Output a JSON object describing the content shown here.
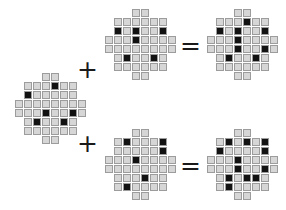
{
  "figure": {
    "colors": {
      "cell_light_fill": "#d6d6d6",
      "cell_light_border": "#9c9c9c",
      "cell_dark_fill": "#121212",
      "background": "#ffffff",
      "operator": "#1a1a1a"
    },
    "grid_size": {
      "cols": 8,
      "rows": 8,
      "cell_px": 9
    }
  },
  "operators": {
    "plus": "+",
    "equals": "="
  },
  "equations": [
    {
      "name": "top-equation",
      "operand_a": "shared-left-grid",
      "operand_b": "top-middle-grid",
      "result": "top-right-grid"
    },
    {
      "name": "bottom-equation",
      "operand_a": "shared-left-grid",
      "operand_b": "bottom-middle-grid",
      "result": "bottom-right-grid"
    }
  ],
  "grids": {
    "left": {
      "label": "shared-left-grid",
      "legend": {
        "0": "empty",
        "1": "light",
        "2": "dark"
      },
      "matrix": [
        [
          0,
          0,
          0,
          1,
          1,
          0,
          0,
          0
        ],
        [
          0,
          1,
          1,
          1,
          2,
          1,
          1,
          0
        ],
        [
          0,
          2,
          1,
          1,
          1,
          1,
          1,
          0
        ],
        [
          1,
          1,
          1,
          1,
          1,
          1,
          1,
          1
        ],
        [
          1,
          1,
          1,
          2,
          1,
          1,
          2,
          1
        ],
        [
          0,
          1,
          2,
          1,
          1,
          2,
          1,
          0
        ],
        [
          0,
          1,
          1,
          1,
          1,
          1,
          1,
          0
        ],
        [
          0,
          0,
          0,
          1,
          1,
          0,
          0,
          0
        ]
      ]
    },
    "top_middle": {
      "label": "top-middle-grid",
      "legend": {
        "0": "empty",
        "1": "light",
        "2": "dark"
      },
      "matrix": [
        [
          0,
          0,
          0,
          1,
          1,
          0,
          0,
          0
        ],
        [
          0,
          1,
          1,
          1,
          1,
          1,
          1,
          0
        ],
        [
          0,
          2,
          1,
          2,
          1,
          1,
          2,
          0
        ],
        [
          1,
          1,
          1,
          2,
          1,
          1,
          1,
          1
        ],
        [
          1,
          1,
          1,
          1,
          1,
          1,
          1,
          1
        ],
        [
          0,
          1,
          2,
          1,
          1,
          2,
          1,
          0
        ],
        [
          0,
          1,
          1,
          1,
          1,
          1,
          1,
          0
        ],
        [
          0,
          0,
          0,
          1,
          1,
          0,
          0,
          0
        ]
      ]
    },
    "top_right": {
      "label": "top-right-grid",
      "legend": {
        "0": "empty",
        "1": "light",
        "2": "dark"
      },
      "matrix": [
        [
          0,
          0,
          0,
          1,
          1,
          0,
          0,
          0
        ],
        [
          0,
          1,
          1,
          1,
          2,
          1,
          1,
          0
        ],
        [
          0,
          2,
          1,
          2,
          1,
          1,
          2,
          0
        ],
        [
          1,
          1,
          1,
          2,
          1,
          1,
          1,
          1
        ],
        [
          1,
          1,
          1,
          2,
          1,
          1,
          2,
          1
        ],
        [
          0,
          1,
          2,
          1,
          1,
          2,
          1,
          0
        ],
        [
          0,
          1,
          1,
          1,
          1,
          1,
          1,
          0
        ],
        [
          0,
          0,
          0,
          1,
          1,
          0,
          0,
          0
        ]
      ]
    },
    "bottom_middle": {
      "label": "bottom-middle-grid",
      "legend": {
        "0": "empty",
        "1": "light",
        "2": "dark"
      },
      "matrix": [
        [
          0,
          0,
          0,
          1,
          1,
          0,
          0,
          0
        ],
        [
          0,
          1,
          2,
          1,
          1,
          1,
          2,
          0
        ],
        [
          0,
          1,
          1,
          1,
          1,
          1,
          2,
          0
        ],
        [
          1,
          1,
          1,
          2,
          1,
          1,
          1,
          1
        ],
        [
          1,
          1,
          1,
          1,
          1,
          1,
          1,
          1
        ],
        [
          0,
          1,
          1,
          1,
          2,
          1,
          1,
          0
        ],
        [
          0,
          1,
          2,
          1,
          1,
          1,
          1,
          0
        ],
        [
          0,
          0,
          0,
          1,
          1,
          0,
          0,
          0
        ]
      ]
    },
    "bottom_right": {
      "label": "bottom-right-grid",
      "legend": {
        "0": "empty",
        "1": "light",
        "2": "dark"
      },
      "matrix": [
        [
          0,
          0,
          0,
          1,
          1,
          0,
          0,
          0
        ],
        [
          0,
          1,
          2,
          1,
          2,
          1,
          2,
          0
        ],
        [
          0,
          2,
          1,
          1,
          1,
          1,
          2,
          0
        ],
        [
          1,
          1,
          1,
          2,
          1,
          1,
          1,
          1
        ],
        [
          1,
          1,
          1,
          2,
          1,
          1,
          2,
          1
        ],
        [
          0,
          1,
          2,
          1,
          2,
          2,
          1,
          0
        ],
        [
          0,
          1,
          2,
          1,
          1,
          1,
          1,
          0
        ],
        [
          0,
          0,
          0,
          1,
          1,
          0,
          0,
          0
        ]
      ]
    }
  },
  "positions": {
    "left": {
      "x": 14,
      "y": 72
    },
    "top_middle": {
      "x": 104,
      "y": 8
    },
    "top_right": {
      "x": 206,
      "y": 8
    },
    "bottom_middle": {
      "x": 104,
      "y": 128
    },
    "bottom_right": {
      "x": 206,
      "y": 128
    },
    "plus_top": {
      "x": 77,
      "y": 57
    },
    "plus_bottom": {
      "x": 77,
      "y": 131
    },
    "eq_top": {
      "x": 180,
      "y": 33
    },
    "eq_bottom": {
      "x": 180,
      "y": 153
    }
  }
}
